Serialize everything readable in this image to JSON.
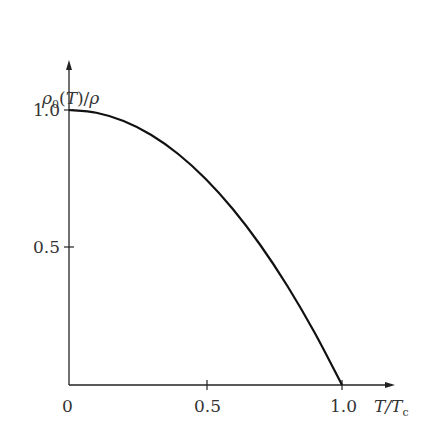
{
  "chart_data": {
    "type": "line",
    "title": "",
    "xlabel": "T/T_c",
    "ylabel": "ρ_0(T)/ρ",
    "x": [
      0,
      0.1,
      0.2,
      0.3,
      0.4,
      0.5,
      0.6,
      0.7,
      0.8,
      0.9,
      1.0
    ],
    "series": [
      {
        "name": "superfluid fraction",
        "values": [
          1.0,
          0.99,
          0.96,
          0.91,
          0.84,
          0.75,
          0.64,
          0.51,
          0.36,
          0.19,
          0.0
        ]
      }
    ],
    "xticks": [
      "0",
      "0.5",
      "1.0"
    ],
    "yticks": [
      "0.5",
      "1.0"
    ],
    "xlim": [
      0,
      1.2
    ],
    "ylim": [
      0,
      1.2
    ],
    "grid": false
  },
  "labels": {
    "y_axis": "ρ0(T)/ρ",
    "x_axis_T": "T/T",
    "x_axis_sub": "c",
    "x0": "0",
    "x05": "0.5",
    "x10": "1.0",
    "y05": "0.5",
    "y10": "1.0"
  }
}
